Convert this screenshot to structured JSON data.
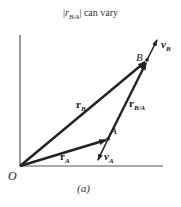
{
  "title": {
    "prefix": "|",
    "symbol": "r",
    "subscript": "B/A",
    "suffix": "| can vary"
  },
  "labels": {
    "origin": "O",
    "point_a": "A",
    "point_b": "B",
    "r_a": "r",
    "r_a_sub": "A",
    "r_b": "r",
    "r_b_sub": "B",
    "r_ba": "r",
    "r_ba_sub": "B/A",
    "v_a": "v",
    "v_a_sub": "A",
    "v_b": "v",
    "v_b_sub": "B"
  },
  "caption": "(a)",
  "colors": {
    "vector": "#222222",
    "axis": "#555555"
  }
}
